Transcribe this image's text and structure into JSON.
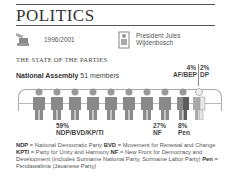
{
  "header": {
    "title": "POLITICS"
  },
  "info": {
    "term": "1996/2001",
    "president_line1": "President Jules",
    "president_line2": "Wijdenbosch"
  },
  "section_title": "THE STATE OF THE PARTIES",
  "assembly": {
    "label": "National Assembly",
    "members": "51 members"
  },
  "parties": [
    {
      "pct": "59%",
      "name": "NDP/BVD/KP/TI",
      "color": "#8a8a8a"
    },
    {
      "pct": "27%",
      "name": "NF",
      "color": "#8a8a8a"
    },
    {
      "pct": "8%",
      "name": "Pen",
      "color": "#6e6e6e"
    },
    {
      "pct": "4%",
      "name": "AF/BEP",
      "color": "#aaaaaa"
    },
    {
      "pct": "2%",
      "name": "DP",
      "color": "#e6e6e6"
    }
  ],
  "legend": [
    {
      "abbr": "NDP",
      "text": " = National Democratic Party  "
    },
    {
      "abbr": "BVD",
      "text": " = Movement for Renewal and Change  "
    },
    {
      "abbr": "KPTI",
      "text": " = Party for Unity and Harmony  "
    },
    {
      "abbr": "NF",
      "text": " = New Front for Democracy and Development (includes Suriname National Party, Suriname Labor Party)  "
    },
    {
      "abbr": "Pen",
      "text": " = Pendawalima (Javanese Party)"
    }
  ]
}
